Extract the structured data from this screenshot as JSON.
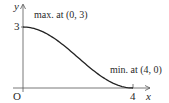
{
  "chart_data": {
    "type": "line",
    "title": "",
    "xlabel": "x",
    "ylabel": "y",
    "origin_label": "O",
    "xlim": [
      0,
      4.3
    ],
    "ylim": [
      0,
      3.4
    ],
    "x_ticks": [
      {
        "value": 4,
        "label": "4"
      }
    ],
    "y_ticks": [
      {
        "value": 3,
        "label": "3"
      }
    ],
    "grid": false,
    "legend": null,
    "series": [
      {
        "name": "curve",
        "description": "smooth decreasing curve with horizontal tangents at endpoints",
        "x": [
          0,
          0.5,
          1,
          1.5,
          2,
          2.5,
          3,
          3.5,
          4
        ],
        "y": [
          3.0,
          2.89,
          2.56,
          2.07,
          1.5,
          0.93,
          0.44,
          0.11,
          0.0
        ]
      }
    ],
    "annotations": [
      {
        "text": "max. at (0, 3)",
        "point": [
          0,
          3
        ]
      },
      {
        "text": "min. at (4, 0)",
        "point": [
          4,
          0
        ]
      }
    ],
    "color": "#222222"
  }
}
